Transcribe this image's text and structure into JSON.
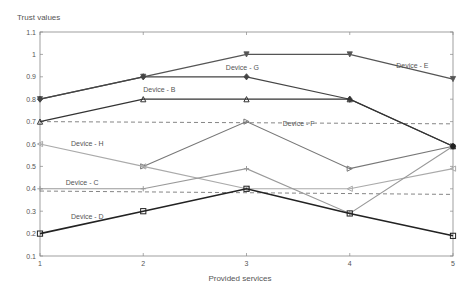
{
  "chart_data": {
    "type": "line",
    "title": "",
    "xlabel": "Provided services",
    "ylabel": "Trust values",
    "x": [
      1,
      2,
      3,
      4,
      5
    ],
    "xlim": [
      1,
      5
    ],
    "ylim": [
      0.1,
      1.1
    ],
    "yticks": [
      "0.1",
      "0.2",
      "0.3",
      "0.4",
      "0.5",
      "0.6",
      "0.7",
      "0.8",
      "0.9",
      "1",
      "1.1"
    ],
    "xticks": [
      "1",
      "2",
      "3",
      "4",
      "5"
    ],
    "grid": false,
    "legend": "inline labels",
    "series": [
      {
        "name": "Device - E",
        "values": [
          0.8,
          0.9,
          1.0,
          1.0,
          0.89
        ],
        "color": "#555555",
        "width": 1.3,
        "marker": "triangle-down",
        "label_pos": [
          4.45,
          0.94
        ]
      },
      {
        "name": "Device - G",
        "values": [
          0.8,
          0.9,
          0.9,
          0.8,
          0.59
        ],
        "color": "#444444",
        "width": 1.2,
        "marker": "diamond",
        "label_pos": [
          2.8,
          0.93
        ]
      },
      {
        "name": "Device - B",
        "values": [
          0.7,
          0.8,
          0.8,
          0.8,
          0.59
        ],
        "color": "#333333",
        "width": 1.2,
        "marker": "triangle-up",
        "label_pos": [
          2.0,
          0.83
        ]
      },
      {
        "name": "Device - F",
        "values": [
          null,
          0.5,
          0.7,
          0.49,
          0.59
        ],
        "color": "#777777",
        "width": 1.1,
        "marker": "triangle-right",
        "label_pos": [
          3.35,
          0.68
        ]
      },
      {
        "name": "Device - H",
        "values": [
          0.6,
          0.5,
          0.4,
          0.4,
          0.49
        ],
        "color": "#aaaaaa",
        "width": 1.1,
        "marker": "triangle-left",
        "label_pos": [
          1.3,
          0.59
        ]
      },
      {
        "name": "Device - C",
        "values": [
          0.4,
          0.4,
          0.49,
          0.29,
          0.59
        ],
        "color": "#999999",
        "width": 1.1,
        "marker": "plus",
        "label_pos": [
          1.25,
          0.415
        ]
      },
      {
        "name": "Device - D",
        "values": [
          0.2,
          0.3,
          0.4,
          0.29,
          0.19
        ],
        "color": "#222222",
        "width": 1.6,
        "marker": "square",
        "label_pos": [
          1.3,
          0.265
        ]
      }
    ],
    "reference_lines": [
      {
        "style": "dashed",
        "color": "#666666",
        "from": [
          1,
          0.7
        ],
        "to": [
          5,
          0.69
        ]
      },
      {
        "style": "dashed",
        "color": "#666666",
        "from": [
          1,
          0.39
        ],
        "to": [
          5,
          0.375
        ]
      }
    ]
  }
}
